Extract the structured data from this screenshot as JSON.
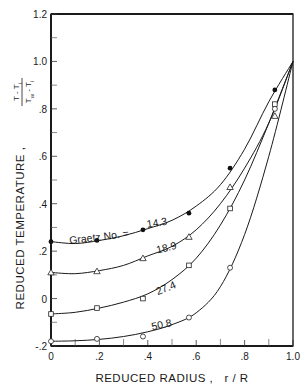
{
  "chart_data": {
    "type": "line",
    "title": "",
    "xlabel": "REDUCED RADIUS ,   r / R",
    "ylabel": "REDUCED TEMPERATURE ,",
    "ylabel_fraction": {
      "numerator": "T - T",
      "numerator_sub": "i",
      "denominator": "T",
      "denominator_sub": "w",
      "denominator_rest": "- T",
      "denominator_rest_sub": "i"
    },
    "xlim": [
      0,
      1.0
    ],
    "ylim": [
      -0.2,
      1.2
    ],
    "grid": false,
    "x_ticks": [
      {
        "v": 0,
        "label": "0"
      },
      {
        "v": 0.2,
        "label": ".2"
      },
      {
        "v": 0.4,
        "label": ".4"
      },
      {
        "v": 0.6,
        "label": ".6"
      },
      {
        "v": 0.8,
        "label": ".8"
      },
      {
        "v": 1.0,
        "label": "1.0"
      }
    ],
    "x_minor_ticks": [
      0.1,
      0.3,
      0.5,
      0.7,
      0.9
    ],
    "y_ticks": [
      {
        "v": -0.2,
        "label": "-.2"
      },
      {
        "v": 0,
        "label": "0"
      },
      {
        "v": 0.2,
        "label": ".2"
      },
      {
        "v": 0.4,
        "label": ".4"
      },
      {
        "v": 0.6,
        "label": ".6"
      },
      {
        "v": 0.8,
        "label": ".8"
      },
      {
        "v": 1.0,
        "label": "1.0"
      },
      {
        "v": 1.2,
        "label": "1.2"
      }
    ],
    "y_minor_ticks": [
      -0.1,
      0.1,
      0.3,
      0.5,
      0.7,
      0.9,
      1.1
    ],
    "legend_prefix": "Graetz No. =",
    "series": [
      {
        "name": "14.3",
        "marker": "filled-circle",
        "points": [
          [
            0,
            0.24
          ],
          [
            0.19,
            0.245
          ],
          [
            0.38,
            0.29
          ],
          [
            0.57,
            0.36
          ],
          [
            0.74,
            0.55
          ],
          [
            0.925,
            0.88
          ],
          [
            1.0,
            1.0
          ]
        ],
        "curve": [
          [
            0,
            0.24
          ],
          [
            0.1,
            0.232
          ],
          [
            0.2,
            0.245
          ],
          [
            0.3,
            0.265
          ],
          [
            0.4,
            0.295
          ],
          [
            0.5,
            0.33
          ],
          [
            0.6,
            0.39
          ],
          [
            0.7,
            0.48
          ],
          [
            0.8,
            0.63
          ],
          [
            0.9,
            0.83
          ],
          [
            1.0,
            1.0
          ]
        ],
        "label_pos": {
          "x": 0.44,
          "y": 0.305,
          "angle": -9
        }
      },
      {
        "name": "18.9",
        "marker": "open-triangle",
        "points": [
          [
            0,
            0.11
          ],
          [
            0.19,
            0.115
          ],
          [
            0.38,
            0.17
          ],
          [
            0.57,
            0.26
          ],
          [
            0.74,
            0.47
          ],
          [
            0.925,
            0.77
          ],
          [
            1.0,
            1.0
          ]
        ],
        "curve": [
          [
            0,
            0.11
          ],
          [
            0.1,
            0.105
          ],
          [
            0.2,
            0.118
          ],
          [
            0.3,
            0.14
          ],
          [
            0.4,
            0.18
          ],
          [
            0.5,
            0.22
          ],
          [
            0.6,
            0.29
          ],
          [
            0.7,
            0.4
          ],
          [
            0.8,
            0.55
          ],
          [
            0.9,
            0.74
          ],
          [
            1.0,
            1.0
          ]
        ],
        "label_pos": {
          "x": 0.48,
          "y": 0.2,
          "angle": -14
        }
      },
      {
        "name": "27.4",
        "marker": "open-square",
        "points": [
          [
            0,
            -0.065
          ],
          [
            0.19,
            -0.04
          ],
          [
            0.38,
            0.0
          ],
          [
            0.57,
            0.14
          ],
          [
            0.74,
            0.38
          ],
          [
            0.925,
            0.82
          ],
          [
            1.0,
            1.0
          ]
        ],
        "curve": [
          [
            0,
            -0.065
          ],
          [
            0.1,
            -0.058
          ],
          [
            0.2,
            -0.04
          ],
          [
            0.3,
            -0.015
          ],
          [
            0.4,
            0.02
          ],
          [
            0.5,
            0.08
          ],
          [
            0.6,
            0.17
          ],
          [
            0.7,
            0.31
          ],
          [
            0.8,
            0.5
          ],
          [
            0.9,
            0.74
          ],
          [
            1.0,
            1.0
          ]
        ],
        "label_pos": {
          "x": 0.48,
          "y": 0.03,
          "angle": -22
        }
      },
      {
        "name": "50.8",
        "marker": "open-circle",
        "points": [
          [
            0,
            -0.18
          ],
          [
            0.19,
            -0.17
          ],
          [
            0.38,
            -0.16
          ],
          [
            0.57,
            -0.08
          ],
          [
            0.74,
            0.13
          ],
          [
            0.925,
            0.8
          ],
          [
            1.0,
            1.0
          ]
        ],
        "curve": [
          [
            0,
            -0.18
          ],
          [
            0.1,
            -0.178
          ],
          [
            0.2,
            -0.172
          ],
          [
            0.3,
            -0.16
          ],
          [
            0.4,
            -0.14
          ],
          [
            0.5,
            -0.11
          ],
          [
            0.6,
            -0.06
          ],
          [
            0.7,
            0.05
          ],
          [
            0.8,
            0.27
          ],
          [
            0.9,
            0.6
          ],
          [
            1.0,
            1.0
          ]
        ],
        "label_pos": {
          "x": 0.46,
          "y": -0.125,
          "angle": -12
        }
      }
    ]
  },
  "plot_area": {
    "left": 51,
    "top": 14,
    "right": 293,
    "bottom": 346
  }
}
